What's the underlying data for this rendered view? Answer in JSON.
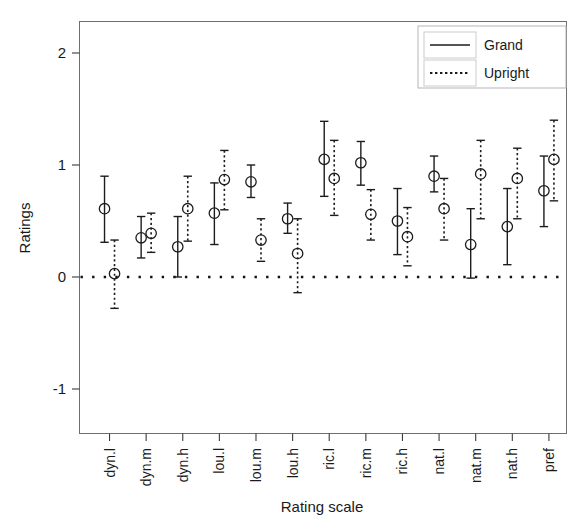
{
  "chart_data": {
    "type": "scatter",
    "title": "",
    "xlabel": "Rating scale",
    "ylabel": "Ratings",
    "ylim": [
      -1.55,
      2.3
    ],
    "yticks": [
      2,
      1,
      0,
      -1
    ],
    "ytick_labels": [
      "2",
      "1",
      "0",
      "-1"
    ],
    "grid": false,
    "legend_position": "top-right",
    "reference_line": {
      "y": 0,
      "style": "dotted"
    },
    "error_bars": "vertical",
    "categories": [
      "dyn.l",
      "dyn.m",
      "dyn.h",
      "lou.l",
      "lou.m",
      "lou.h",
      "ric.l",
      "ric.m",
      "ric.h",
      "nat.l",
      "nat.m",
      "nat.h",
      "pref"
    ],
    "series": [
      {
        "name": "Grand",
        "style": "solid",
        "values": [
          0.61,
          0.35,
          0.27,
          0.57,
          0.85,
          0.52,
          1.05,
          1.02,
          0.5,
          0.9,
          0.29,
          0.45,
          0.77
        ],
        "lower": [
          0.31,
          0.17,
          0.0,
          0.29,
          0.71,
          0.39,
          0.72,
          0.82,
          0.2,
          0.76,
          -0.01,
          0.11,
          0.45
        ],
        "upper": [
          0.9,
          0.54,
          0.54,
          0.84,
          1.0,
          0.66,
          1.39,
          1.21,
          0.79,
          1.08,
          0.61,
          0.79,
          1.08
        ]
      },
      {
        "name": "Upright",
        "style": "dotted",
        "values": [
          0.03,
          0.39,
          0.61,
          0.87,
          0.33,
          0.21,
          0.88,
          0.56,
          0.36,
          0.61,
          0.92,
          0.88,
          1.05
        ],
        "lower": [
          -0.28,
          0.22,
          0.32,
          0.6,
          0.14,
          -0.14,
          0.55,
          0.33,
          0.1,
          0.33,
          0.52,
          0.52,
          0.68
        ],
        "upper": [
          0.33,
          0.57,
          0.9,
          1.13,
          0.52,
          0.52,
          1.22,
          0.78,
          0.62,
          0.88,
          1.22,
          1.15,
          1.4
        ]
      }
    ]
  },
  "legend": {
    "entries": [
      {
        "label": "Grand",
        "style": "solid"
      },
      {
        "label": "Upright",
        "style": "dotted"
      }
    ]
  },
  "axes": {
    "y_title": "Ratings",
    "x_title": "Rating scale"
  }
}
